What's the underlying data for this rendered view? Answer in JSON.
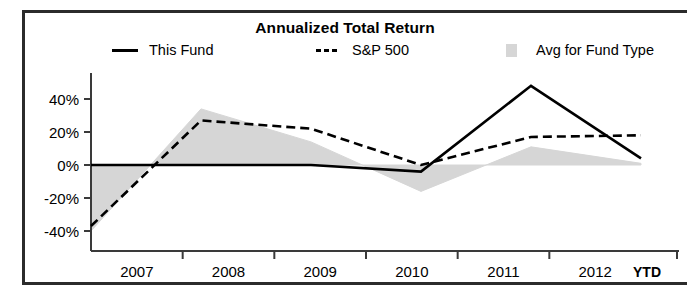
{
  "chart_data": {
    "type": "line",
    "title": "Annualized Total Return",
    "xlabel": "",
    "ylabel": "",
    "categories": [
      "2007",
      "2008",
      "2009",
      "2010",
      "2011",
      "2012"
    ],
    "x_axis_suffix": "YTD",
    "y_tick_labels": [
      "40%",
      "20%",
      "0%",
      "-20%",
      "-40%"
    ],
    "y_tick_values": [
      40,
      20,
      0,
      -20,
      -40
    ],
    "ylim": [
      -48,
      46
    ],
    "grid": false,
    "legend_position": "top",
    "series": [
      {
        "name": "This Fund",
        "style": "solid",
        "color": "#000000",
        "values": [
          0,
          0,
          0,
          -4,
          48,
          4
        ]
      },
      {
        "name": "S&P 500",
        "style": "dashed",
        "color": "#000000",
        "values": [
          -37,
          27,
          22,
          0,
          17,
          18
        ]
      },
      {
        "name": "Avg for Fund Type",
        "style": "area",
        "color": "#d6d6d6",
        "values": [
          -40,
          34,
          14,
          -16,
          11,
          1
        ]
      }
    ]
  },
  "legend": {
    "items": [
      {
        "label": "This Fund",
        "marker": "solid-line-swatch"
      },
      {
        "label": "S&P 500",
        "marker": "dashed-line-swatch"
      },
      {
        "label": "Avg for Fund Type",
        "marker": "area-swatch"
      }
    ]
  },
  "colors": {
    "frame": "#2b2b2b",
    "line": "#000000",
    "band": "#d6d6d6",
    "background": "#ffffff"
  }
}
